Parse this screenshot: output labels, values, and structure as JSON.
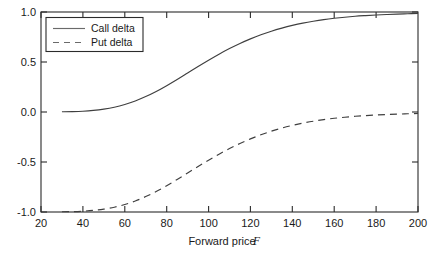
{
  "chart_data": {
    "type": "line",
    "title": "",
    "xlabel": "Forward price F",
    "xlabel_plain": "Forward price",
    "xlabel_symbol": "F",
    "ylabel": "",
    "xlim": [
      20,
      200
    ],
    "ylim": [
      -1.0,
      1.0
    ],
    "grid": false,
    "legend_position": "upper left",
    "xticks": [
      20,
      40,
      60,
      80,
      100,
      120,
      140,
      160,
      180,
      200
    ],
    "xtick_labels": [
      "20",
      "40",
      "60",
      "80",
      "100",
      "120",
      "140",
      "160",
      "180",
      "200"
    ],
    "yticks": [
      -1.0,
      -0.5,
      0.0,
      0.5,
      1.0
    ],
    "ytick_labels": [
      "-1.0",
      "-0.5",
      "0.0",
      "0.5",
      "1.0"
    ],
    "x": [
      30,
      35,
      40,
      45,
      50,
      55,
      60,
      65,
      70,
      75,
      80,
      85,
      90,
      95,
      100,
      105,
      110,
      115,
      120,
      125,
      130,
      135,
      140,
      145,
      150,
      155,
      160,
      165,
      170,
      175,
      180,
      185,
      190,
      195,
      200
    ],
    "series": [
      {
        "name": "Call delta",
        "style": "solid",
        "color": "#3f3f3f",
        "values": [
          0.002,
          0.004,
          0.008,
          0.016,
          0.029,
          0.048,
          0.075,
          0.11,
          0.154,
          0.205,
          0.263,
          0.325,
          0.39,
          0.455,
          0.518,
          0.578,
          0.634,
          0.685,
          0.731,
          0.772,
          0.808,
          0.839,
          0.866,
          0.889,
          0.908,
          0.924,
          0.937,
          0.948,
          0.957,
          0.964,
          0.97,
          0.975,
          0.979,
          0.982,
          0.985
        ]
      },
      {
        "name": "Put delta",
        "style": "dashed",
        "color": "#3f3f3f",
        "values": [
          -0.998,
          -0.996,
          -0.992,
          -0.984,
          -0.971,
          -0.952,
          -0.925,
          -0.89,
          -0.846,
          -0.795,
          -0.737,
          -0.675,
          -0.61,
          -0.545,
          -0.482,
          -0.422,
          -0.366,
          -0.315,
          -0.269,
          -0.228,
          -0.192,
          -0.161,
          -0.134,
          -0.111,
          -0.092,
          -0.076,
          -0.063,
          -0.052,
          -0.043,
          -0.036,
          -0.03,
          -0.025,
          -0.021,
          -0.018,
          -0.015
        ]
      }
    ],
    "legend": [
      "Call delta",
      "Put delta"
    ]
  },
  "legend": {
    "entries": [
      {
        "label": "Call delta",
        "style": "solid"
      },
      {
        "label": "Put delta",
        "style": "dashed"
      }
    ]
  },
  "axes": {
    "x_title_plain": "Forward price",
    "x_title_symbol": "F"
  }
}
